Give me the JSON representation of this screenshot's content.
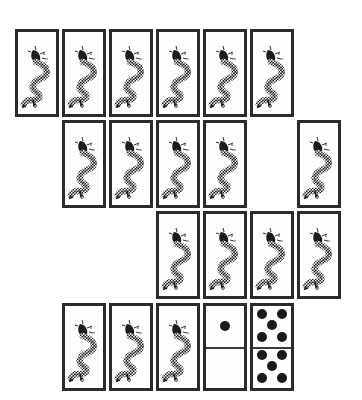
{
  "game": {
    "type": "tile-matching solitaire",
    "colors": {
      "border": "#2b2b2b",
      "pip": "#1a1a1a",
      "background": "#ffffff"
    },
    "tile_size": {
      "width": 44,
      "height": 88
    },
    "rows": [
      {
        "row": 1,
        "tiles": [
          {
            "x": 15,
            "y": 29,
            "face": "dragon"
          },
          {
            "x": 62,
            "y": 29,
            "face": "dragon"
          },
          {
            "x": 109,
            "y": 29,
            "face": "dragon"
          },
          {
            "x": 156,
            "y": 29,
            "face": "dragon"
          },
          {
            "x": 203,
            "y": 29,
            "face": "dragon"
          },
          {
            "x": 250,
            "y": 29,
            "face": "dragon"
          }
        ]
      },
      {
        "row": 2,
        "tiles": [
          {
            "x": 62,
            "y": 120,
            "face": "dragon"
          },
          {
            "x": 109,
            "y": 120,
            "face": "dragon"
          },
          {
            "x": 156,
            "y": 120,
            "face": "dragon"
          },
          {
            "x": 203,
            "y": 120,
            "face": "dragon"
          },
          {
            "x": 297,
            "y": 120,
            "face": "dragon"
          }
        ]
      },
      {
        "row": 3,
        "tiles": [
          {
            "x": 156,
            "y": 211,
            "face": "dragon"
          },
          {
            "x": 203,
            "y": 211,
            "face": "dragon"
          },
          {
            "x": 250,
            "y": 211,
            "face": "dragon"
          },
          {
            "x": 297,
            "y": 211,
            "face": "dragon"
          }
        ]
      },
      {
        "row": 4,
        "tiles": [
          {
            "x": 62,
            "y": 303,
            "face": "dragon"
          },
          {
            "x": 109,
            "y": 303,
            "face": "dragon"
          },
          {
            "x": 156,
            "y": 303,
            "face": "dragon"
          },
          {
            "x": 203,
            "y": 303,
            "face": "domino",
            "top_pips": 1,
            "bottom_pips": 0
          },
          {
            "x": 250,
            "y": 303,
            "face": "domino",
            "top_pips": 5,
            "bottom_pips": 5
          }
        ]
      }
    ],
    "counts": {
      "dragon_tiles": 18,
      "domino_tiles": 2,
      "total_tiles": 20
    }
  }
}
